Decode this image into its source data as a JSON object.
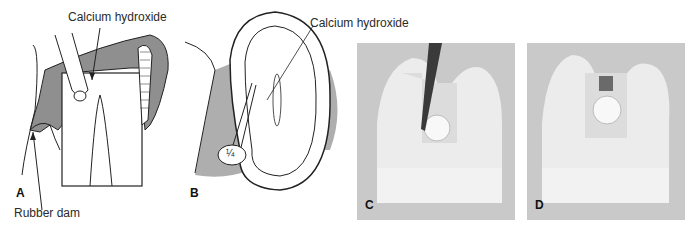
{
  "figure": {
    "panels": [
      {
        "id": "A",
        "letter": "A",
        "type": "illustration",
        "labels": {
          "top": "Calcium hydroxide",
          "bottom": "Rubber dam"
        }
      },
      {
        "id": "B",
        "letter": "B",
        "type": "illustration",
        "labels": {
          "top": "Calcium hydroxide",
          "inset": "¼"
        }
      },
      {
        "id": "C",
        "letter": "C",
        "type": "photograph"
      },
      {
        "id": "D",
        "letter": "D",
        "type": "photograph"
      }
    ],
    "colors": {
      "tissue_shade": "#8f8f8f",
      "photo_bg": "#c9c9c9",
      "tooth_model": "#f2f2f2",
      "line": "#222222"
    }
  }
}
